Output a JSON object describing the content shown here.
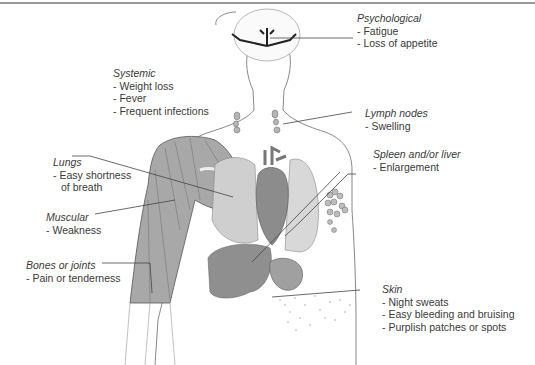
{
  "diagram": {
    "colors": {
      "outline": "#555555",
      "muscle": "#a8a8a8",
      "organ_dark": "#8c8c8c",
      "organ_light": "#d6d6d6",
      "leader_line": "#444444",
      "text": "#3a3a3a",
      "rule": "#9a9a9a"
    },
    "labels": [
      {
        "id": "psychological",
        "title": "Psychological",
        "items": [
          "- Fatigue",
          "- Loss of appetite"
        ]
      },
      {
        "id": "systemic",
        "title": "Systemic",
        "items": [
          "- Weight loss",
          "- Fever",
          "- Frequent infections"
        ]
      },
      {
        "id": "lymph-nodes",
        "title": "Lymph nodes",
        "items": [
          "- Swelling"
        ]
      },
      {
        "id": "lungs",
        "title": "Lungs",
        "items": [
          "- Easy shortness",
          "  of breath"
        ]
      },
      {
        "id": "spleen-liver",
        "title": "Spleen and/or liver",
        "items": [
          "- Enlargement"
        ]
      },
      {
        "id": "muscular",
        "title": "Muscular",
        "items": [
          "- Weakness"
        ]
      },
      {
        "id": "bones-joints",
        "title": "Bones or joints",
        "items": [
          "- Pain or tenderness"
        ]
      },
      {
        "id": "skin",
        "title": "Skin",
        "items": [
          "- Night sweats",
          "- Easy bleeding and bruising",
          "- Purplish patches or spots"
        ]
      }
    ]
  }
}
